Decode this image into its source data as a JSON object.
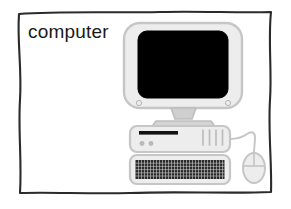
{
  "card": {
    "label": "computer",
    "border_color": "#2b2b2b",
    "background_color": "#ffffff"
  },
  "illustration": {
    "name": "desktop-computer-illustration",
    "style": "grayscale-line-drawing",
    "outline_color": "#bdbdbd",
    "body_fill": "#ededed",
    "screen_color": "#000000",
    "accent_dark": "#111111",
    "parts": [
      {
        "name": "monitor",
        "label": "CRT monitor",
        "screen_label": "blank screen",
        "bezel_indicators": 2
      },
      {
        "name": "monitor-stand",
        "label": "monitor stand"
      },
      {
        "name": "tower",
        "label": "computer tower",
        "disk_slot_label": "disk drive slot",
        "buttons": 2,
        "vent_lines": 4
      },
      {
        "name": "keyboard",
        "label": "keyboard",
        "key_rows": 5,
        "key_columns": 29
      },
      {
        "name": "mouse",
        "label": "mouse",
        "cable_label": "mouse cable",
        "buttons": 2
      }
    ]
  }
}
